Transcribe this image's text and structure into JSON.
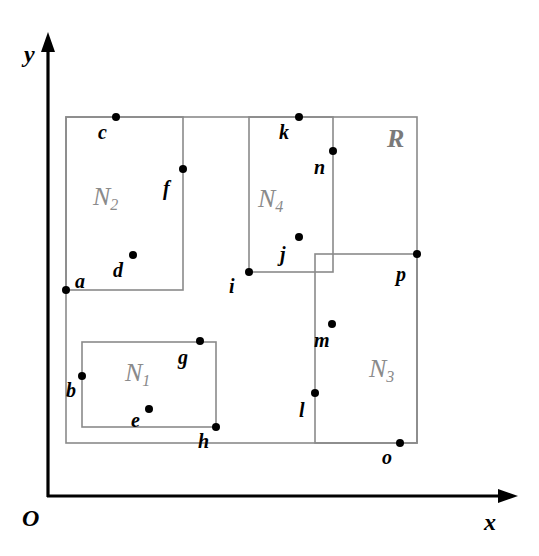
{
  "diagram": {
    "title": "",
    "axes": {
      "origin_label": "O",
      "x_label": "x",
      "y_label": "y"
    },
    "regions": [
      {
        "id": "R",
        "label": "R",
        "sub": "",
        "x": 66,
        "y": 117,
        "w": 351,
        "h": 326
      },
      {
        "id": "N1",
        "label": "N",
        "sub": "1",
        "x": 82,
        "y": 342,
        "w": 134,
        "h": 85
      },
      {
        "id": "N2",
        "label": "N",
        "sub": "2",
        "x": 66,
        "y": 117,
        "w": 117,
        "h": 173
      },
      {
        "id": "N3",
        "label": "N",
        "sub": "3",
        "x": 315,
        "y": 254,
        "w": 102,
        "h": 189
      },
      {
        "id": "N4",
        "label": "N",
        "sub": "4",
        "x": 249,
        "y": 117,
        "w": 84,
        "h": 155
      }
    ],
    "points": [
      {
        "name": "a",
        "x": 66,
        "y": 290
      },
      {
        "name": "b",
        "x": 82,
        "y": 376
      },
      {
        "name": "c",
        "x": 116,
        "y": 117
      },
      {
        "name": "d",
        "x": 133,
        "y": 255
      },
      {
        "name": "e",
        "x": 149,
        "y": 409
      },
      {
        "name": "f",
        "x": 183,
        "y": 169
      },
      {
        "name": "g",
        "x": 200,
        "y": 341
      },
      {
        "name": "h",
        "x": 216,
        "y": 427
      },
      {
        "name": "i",
        "x": 249,
        "y": 272
      },
      {
        "name": "j",
        "x": 299,
        "y": 237
      },
      {
        "name": "k",
        "x": 299,
        "y": 117
      },
      {
        "name": "l",
        "x": 315,
        "y": 393
      },
      {
        "name": "m",
        "x": 332,
        "y": 324
      },
      {
        "name": "n",
        "x": 333,
        "y": 151
      },
      {
        "name": "o",
        "x": 400,
        "y": 443
      },
      {
        "name": "p",
        "x": 417,
        "y": 254
      }
    ],
    "colors": {
      "rect_stroke": "#8a8a8a",
      "region_label": "#8a8a8a",
      "point": "#000000",
      "axis": "#000000"
    }
  }
}
